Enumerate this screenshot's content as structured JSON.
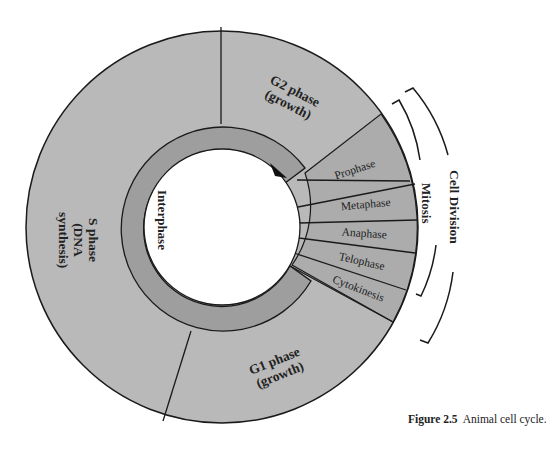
{
  "figure": {
    "number_label": "Figure 2.5",
    "caption": "Animal cell cycle."
  },
  "colors": {
    "outer_ring": "#b9b9b9",
    "mitosis_wedges": "#acacac",
    "inner_ring": "#9e9e9e",
    "center": "#ffffff",
    "stroke": "#1a1a1a"
  },
  "ring": {
    "inner_label": "Interphase"
  },
  "phases": {
    "g2": {
      "line1": "G2 phase",
      "line2": "(growth)"
    },
    "s": {
      "line1": "S phase",
      "line2": "(DNA",
      "line3": "synthesis)"
    },
    "g1": {
      "line1": "G1 phase",
      "line2": "(growth)"
    }
  },
  "mitosis_stages": [
    {
      "label": "Prophase"
    },
    {
      "label": "Metaphase"
    },
    {
      "label": "Anaphase"
    },
    {
      "label": "Telophase"
    },
    {
      "label": "Cytokinesis"
    }
  ],
  "brackets": {
    "mitosis": "Mitosis",
    "cell_division": "Cell Division"
  }
}
